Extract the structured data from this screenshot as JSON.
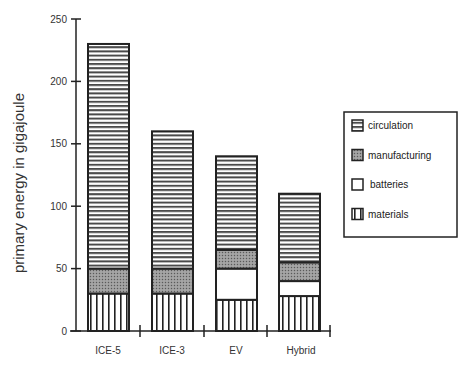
{
  "chart_data": {
    "type": "bar",
    "stacked": true,
    "title": "",
    "xlabel": "",
    "ylabel": "primary energy  in gigajoule",
    "ylim": [
      0,
      250
    ],
    "yticks": [
      0,
      50,
      100,
      150,
      200,
      250
    ],
    "grid": false,
    "legend_position": "right",
    "categories": [
      "ICE-5",
      "ICE-3",
      "EV",
      "Hybrid"
    ],
    "series": [
      {
        "name": "materials",
        "pattern": "vertical-lines",
        "values": [
          30,
          30,
          25,
          28
        ]
      },
      {
        "name": "batteries",
        "pattern": "blank",
        "values": [
          0,
          0,
          25,
          12
        ]
      },
      {
        "name": "manufacturing",
        "pattern": "dotted-gray",
        "values": [
          20,
          20,
          15,
          15
        ]
      },
      {
        "name": "circulation",
        "pattern": "horizontal-lines",
        "values": [
          180,
          110,
          75,
          55
        ]
      }
    ],
    "totals": [
      230,
      160,
      140,
      110
    ]
  },
  "legend": {
    "items": [
      {
        "label": "circulation",
        "pattern": "horizontal-lines"
      },
      {
        "label": "manufacturing",
        "pattern": "dotted-gray"
      },
      {
        "label": "batteries",
        "pattern": "blank"
      },
      {
        "label": "materials",
        "pattern": "vertical-lines"
      }
    ]
  },
  "colors": {
    "stroke": "#222222",
    "hatch": "#333333",
    "dotted_fill": "#8a8a8a",
    "background": "#ffffff"
  }
}
